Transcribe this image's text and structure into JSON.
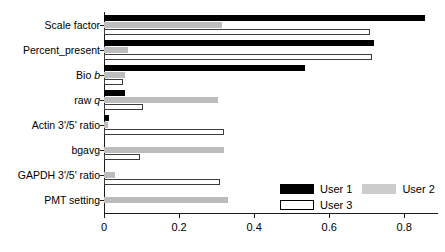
{
  "chart_data": {
    "type": "bar",
    "orientation": "horizontal",
    "title": "",
    "xlabel": "",
    "ylabel": "",
    "xlim": [
      0,
      0.89
    ],
    "xticks": [
      0,
      0.2,
      0.4,
      0.6,
      0.8
    ],
    "xticklabels": [
      "0",
      "0.2",
      "0.4",
      "0.6",
      "0.8"
    ],
    "grid": false,
    "legend_position": "bottom-right",
    "categories": [
      "Scale factor",
      "Percent_present",
      "Bio b",
      "raw q",
      "Actin 3'/5' ratio",
      "bgavg",
      "GAPDH 3'/5' ratio",
      "PMT setting"
    ],
    "categories_html": [
      "Scale factor",
      "Percent_present",
      "Bio <i>b</i>",
      "raw <i>q</i>",
      "Actin 3'/5' ratio",
      "bgavg",
      "GAPDH 3'/5' ratio",
      "PMT setting"
    ],
    "series": [
      {
        "name": "User 1",
        "color": "#000000",
        "values": [
          0.855,
          0.72,
          0.536,
          0.055,
          0.012,
          0.0,
          0.0,
          0.0
        ]
      },
      {
        "name": "User 2",
        "color": "#bdbdbd",
        "values": [
          0.315,
          0.065,
          0.056,
          0.305,
          0.01,
          0.32,
          0.03,
          0.33
        ]
      },
      {
        "name": "User 3",
        "color": "#ffffff",
        "values": [
          0.71,
          0.715,
          0.05,
          0.105,
          0.32,
          0.095,
          0.31,
          0.0
        ]
      }
    ]
  },
  "legend": {
    "entries": [
      {
        "label": "User 1",
        "series": 0
      },
      {
        "label": "User 2",
        "series": 1
      },
      {
        "label": "User 3",
        "series": 2
      }
    ]
  }
}
